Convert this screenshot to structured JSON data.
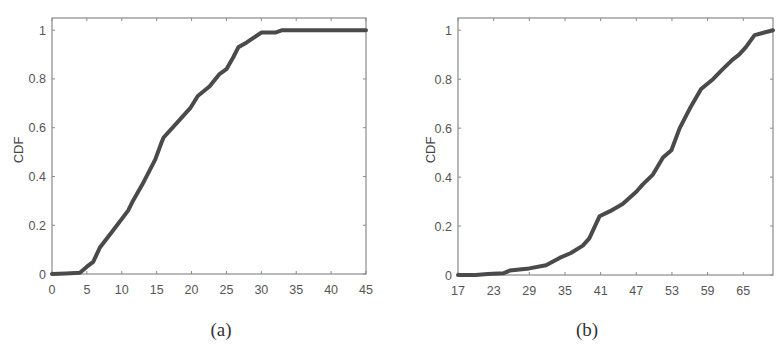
{
  "chart_data": [
    {
      "type": "line",
      "title": "",
      "caption": "(a)",
      "xlabel": "",
      "ylabel": "CDF",
      "xlim": [
        0,
        45
      ],
      "ylim": [
        0,
        1.05
      ],
      "xticks": [
        0,
        5,
        10,
        15,
        20,
        25,
        30,
        35,
        40,
        45
      ],
      "xtick_labels": [
        "0",
        "5",
        "10",
        "15",
        "20",
        "25",
        "30",
        "35",
        "40",
        "45"
      ],
      "yticks": [
        0,
        0.2,
        0.4,
        0.6,
        0.8,
        1
      ],
      "ytick_labels": [
        "0",
        "0.2",
        "0.4",
        "0.6",
        "0.8",
        "1"
      ],
      "grid": false,
      "series": [
        {
          "name": "CDF",
          "color": "#4a4a4a",
          "x": [
            0,
            2,
            4,
            5,
            5.9,
            6.9,
            8.8,
            10.9,
            11.6,
            13,
            14.8,
            15.7,
            16,
            17.9,
            19.8,
            20.9,
            22.6,
            24,
            25,
            26,
            26.7,
            27.9,
            30,
            32,
            33,
            35,
            40,
            45
          ],
          "y": [
            0,
            0.002,
            0.005,
            0.03,
            0.05,
            0.11,
            0.18,
            0.26,
            0.3,
            0.37,
            0.47,
            0.54,
            0.56,
            0.62,
            0.68,
            0.73,
            0.77,
            0.82,
            0.84,
            0.89,
            0.93,
            0.95,
            0.99,
            0.99,
            1.0,
            1.0,
            1.0,
            1.0
          ]
        }
      ]
    },
    {
      "type": "line",
      "title": "",
      "caption": "(b)",
      "xlabel": "",
      "ylabel": "CDF",
      "xlim": [
        17,
        70
      ],
      "ylim": [
        0,
        1.05
      ],
      "xticks": [
        17,
        23,
        29,
        35,
        41,
        47,
        53,
        59,
        65
      ],
      "xtick_labels": [
        "17",
        "23",
        "29",
        "35",
        "41",
        "47",
        "53",
        "59",
        "65"
      ],
      "yticks": [
        0,
        0.2,
        0.4,
        0.6,
        0.8,
        1
      ],
      "ytick_labels": [
        "0",
        "0.2",
        "0.4",
        "0.6",
        "0.8",
        "1"
      ],
      "grid": false,
      "series": [
        {
          "name": "CDF",
          "color": "#4a4a4a",
          "x": [
            17,
            20,
            22,
            24.6,
            25.7,
            29,
            31.8,
            34.1,
            36,
            38,
            39.1,
            40.8,
            42.5,
            44.7,
            47,
            48.1,
            49.8,
            51.5,
            52.9,
            54.3,
            56,
            57.9,
            59.9,
            61.5,
            63.2,
            64.3,
            65.4,
            66.9,
            70
          ],
          "y": [
            0,
            0,
            0.004,
            0.007,
            0.018,
            0.027,
            0.04,
            0.07,
            0.09,
            0.12,
            0.15,
            0.24,
            0.26,
            0.29,
            0.34,
            0.37,
            0.41,
            0.48,
            0.51,
            0.6,
            0.68,
            0.76,
            0.8,
            0.84,
            0.88,
            0.9,
            0.93,
            0.98,
            1.0
          ]
        }
      ]
    }
  ]
}
